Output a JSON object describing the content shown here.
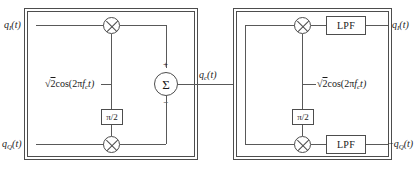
{
  "diagram": {
    "type": "block-diagram",
    "stroke_color": "#4d4d4d",
    "wire_color": "#595959",
    "background": "#ffffff"
  },
  "modulator": {
    "name": "QAM modulator block",
    "inputs": [
      {
        "label_q": "q",
        "label_sub": "I",
        "label_t": "(t)",
        "full": "q_I(t)"
      },
      {
        "label_q": "q",
        "label_sub": "Q",
        "label_t": "(t)",
        "full": "q_Q(t)"
      }
    ],
    "carrier": {
      "prefix": "2",
      "body": "cos(2π",
      "sub": "f",
      "subsub": "c",
      "suffix": "t)",
      "full": "√2cos(2πf_c t)"
    },
    "phase_shifter": {
      "label": "π/2"
    },
    "multipliers": [
      {
        "label": "⊗"
      },
      {
        "label": "⊗"
      }
    ],
    "summer": {
      "label": "Σ",
      "plus_sign": "+",
      "minus_sign": "−"
    },
    "output": {
      "label_q": "q",
      "label_sub": "c",
      "label_t": "(t)",
      "full": "q_c(t)"
    }
  },
  "demodulator": {
    "name": "QAM demodulator block",
    "input": {
      "full": "q_c(t)"
    },
    "carrier": {
      "prefix": "2",
      "body": "cos(2π",
      "sub": "f",
      "subsub": "c",
      "suffix": "t)",
      "full": "√2cos(2πf_c t)"
    },
    "phase_shifter": {
      "label": "π/2"
    },
    "multipliers": [
      {
        "label": "⊗"
      },
      {
        "label": "⊗"
      }
    ],
    "filters": [
      {
        "label": "LPF"
      },
      {
        "label": "LPF"
      }
    ],
    "outputs": [
      {
        "prefix": "",
        "label_q": "q",
        "label_sub": "I",
        "label_t": "(t)",
        "full": "q_I(t)"
      },
      {
        "prefix": "−",
        "label_q": "q",
        "label_sub": "Q",
        "label_t": "(t)",
        "full": "−q_Q(t)"
      }
    ]
  },
  "symbols": {
    "radical": "√",
    "sqrt_operand": "2"
  }
}
